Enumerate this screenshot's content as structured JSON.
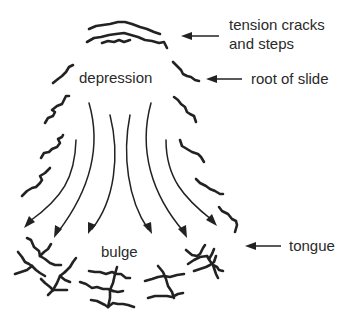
{
  "diagram": {
    "labels": {
      "tension_cracks_line1": "tension cracks",
      "tension_cracks_line2": "and steps",
      "root_of_slide": "root of slide",
      "depression": "depression",
      "bulge": "bulge",
      "tongue": "tongue"
    },
    "components": [
      {
        "id": "tension-cracks",
        "label": "tension cracks and steps",
        "position": "top"
      },
      {
        "id": "root-of-slide",
        "label": "root of slide",
        "position": "upper-right flank"
      },
      {
        "id": "depression",
        "label": "depression",
        "position": "upper center"
      },
      {
        "id": "flow-arrows",
        "count": 6,
        "direction": "downslope, diverging"
      },
      {
        "id": "bulge",
        "label": "bulge",
        "position": "lower center"
      },
      {
        "id": "tongue",
        "label": "tongue",
        "position": "toe"
      }
    ],
    "colors": {
      "stroke": "#222222",
      "text": "#2a2a2a",
      "background": "#ffffff"
    }
  }
}
